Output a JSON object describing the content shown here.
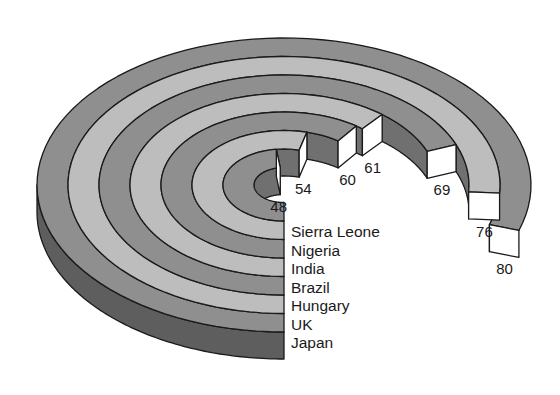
{
  "chart_data": {
    "type": "radial-bar",
    "title": "",
    "categories": [
      "Sierra Leone",
      "Nigeria",
      "India",
      "Brazil",
      "Hungary",
      "UK",
      "Japan"
    ],
    "values": [
      48,
      54,
      60,
      61,
      69,
      76,
      80
    ],
    "value_labels": [
      "48",
      "54",
      "60",
      "61",
      "69",
      "76",
      "80"
    ],
    "scale_max": 100,
    "start_angle": "bottom",
    "direction": "clockwise",
    "ring_order": "innermost-first",
    "colors": {
      "ring_dark": "#8f8f8f",
      "ring_light": "#bdbdbd",
      "wall": "#707070",
      "front_side": "#5e5e5e",
      "end_cap": "#ffffff",
      "outline": "#1a1a1a"
    }
  }
}
